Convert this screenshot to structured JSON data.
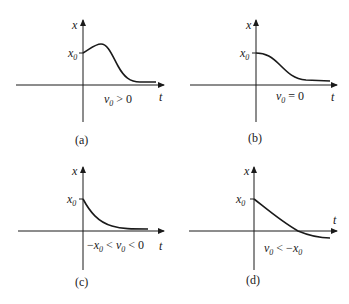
{
  "panels": [
    {
      "id": "a",
      "caption": "(a)",
      "y_axis_label": "x",
      "x_axis_label": "t",
      "y_tick_label": "x0",
      "condition": "v0 > 0",
      "description": "Overdamped response rising from x0 to a peak, then decaying to zero"
    },
    {
      "id": "b",
      "caption": "(b)",
      "y_axis_label": "x",
      "x_axis_label": "t",
      "y_tick_label": "x0",
      "condition": "v0 = 0",
      "description": "Decay from x0 with zero initial slope"
    },
    {
      "id": "c",
      "caption": "(c)",
      "y_axis_label": "x",
      "x_axis_label": "t",
      "y_tick_label": "x0",
      "condition": "−x0 < v0 < 0",
      "description": "Monotonic decay from x0 without crossing zero"
    },
    {
      "id": "d",
      "caption": "(d)",
      "y_axis_label": "x",
      "x_axis_label": "t",
      "y_tick_label": "x0",
      "condition": "v0 < −x0",
      "description": "Decay from x0 that crosses zero once then approaches from below"
    }
  ],
  "colors": {
    "ink": "#1a1a1a",
    "background": "#ffffff"
  }
}
